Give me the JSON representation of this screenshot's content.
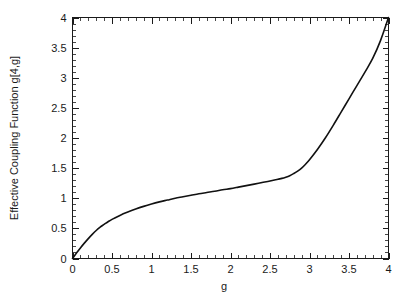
{
  "chart_data": {
    "type": "line",
    "title": "",
    "xlabel": "g",
    "ylabel": "Effective Coupling Function g[4,g]",
    "xlim": [
      0,
      4
    ],
    "ylim": [
      0,
      4
    ],
    "grid": false,
    "legend": null,
    "x_ticks": [
      0,
      0.5,
      1,
      1.5,
      2,
      2.5,
      3,
      3.5,
      4
    ],
    "x_tick_labels": [
      "0",
      "0.5",
      "1",
      "1.5",
      "2",
      "2.5",
      "3",
      "3.5",
      "4"
    ],
    "y_ticks": [
      0,
      0.5,
      1,
      1.5,
      2,
      2.5,
      3,
      3.5,
      4
    ],
    "y_tick_labels": [
      "0",
      "0.5",
      "1",
      "1.5",
      "2",
      "2.5",
      "3",
      "3.5",
      "4"
    ],
    "x_minor_tick_count": 5,
    "y_minor_tick_count": 5,
    "series": [
      {
        "name": "g[4,g]",
        "color": "#111111",
        "x": [
          0.0,
          0.05,
          0.1,
          0.15,
          0.2,
          0.25,
          0.3,
          0.35,
          0.4,
          0.45,
          0.5,
          0.6,
          0.7,
          0.8,
          0.9,
          1.0,
          1.1,
          1.2,
          1.3,
          1.4,
          1.5,
          1.6,
          1.7,
          1.8,
          1.9,
          2.0,
          2.1,
          2.2,
          2.3,
          2.4,
          2.5,
          2.6,
          2.65,
          2.7,
          2.75,
          2.8,
          2.85,
          2.9,
          2.95,
          3.0,
          3.1,
          3.2,
          3.3,
          3.4,
          3.5,
          3.6,
          3.7,
          3.8,
          3.9,
          4.0
        ],
        "y": [
          0.0,
          0.09,
          0.175,
          0.255,
          0.33,
          0.4,
          0.465,
          0.52,
          0.565,
          0.61,
          0.65,
          0.715,
          0.77,
          0.82,
          0.865,
          0.905,
          0.94,
          0.97,
          1.0,
          1.025,
          1.05,
          1.075,
          1.095,
          1.115,
          1.14,
          1.16,
          1.185,
          1.21,
          1.235,
          1.26,
          1.285,
          1.315,
          1.33,
          1.35,
          1.375,
          1.41,
          1.45,
          1.5,
          1.565,
          1.64,
          1.81,
          2.0,
          2.21,
          2.43,
          2.65,
          2.87,
          3.09,
          3.32,
          3.62,
          4.0
        ]
      }
    ]
  },
  "axis": {
    "x_label": "g",
    "y_label": "Effective Coupling Function g[4,g]"
  }
}
